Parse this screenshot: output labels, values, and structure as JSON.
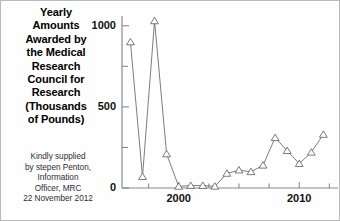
{
  "title": {
    "lines": [
      "Yearly",
      "Amounts",
      "Awarded by",
      "the Medical",
      "Research",
      "Council for",
      "Research",
      "(Thousands",
      "of Pounds)"
    ],
    "full": "Yearly Amounts Awarded by the Medical Research Council for Research (Thousands of Pounds)"
  },
  "credit": {
    "lines": [
      "Kindly supplied",
      "by stepen Penton,",
      "Information",
      "Officer, MRC",
      "22 November 2012"
    ],
    "full": "Kindly supplied by stepen Penton, Information Officer, MRC 22 November 2012"
  },
  "colors": {
    "line": "#6e6e6e",
    "marker_stroke": "#5a5a5a",
    "marker_fill": "#ffffff",
    "axis": "#808080",
    "text": "#000000",
    "background": "#ffffff",
    "border": "#b9b9b9"
  },
  "chart_data": {
    "type": "line",
    "title": "Yearly Amounts Awarded by the Medical Research Council for Research (Thousands of Pounds)",
    "xlabel": "",
    "ylabel": "Thousands of Pounds",
    "x": [
      1996,
      1997,
      1998,
      1999,
      2000,
      2001,
      2002,
      2003,
      2004,
      2005,
      2006,
      2007,
      2008,
      2009,
      2010,
      2011,
      2012
    ],
    "values": [
      900,
      70,
      1030,
      210,
      10,
      15,
      15,
      10,
      90,
      110,
      100,
      140,
      310,
      230,
      150,
      220,
      330
    ],
    "series": [
      {
        "name": "Yearly Amount Awarded",
        "values": [
          900,
          70,
          1030,
          210,
          10,
          15,
          15,
          10,
          90,
          110,
          100,
          140,
          310,
          230,
          150,
          220,
          330
        ]
      }
    ],
    "xlim": [
      1995.3,
      2012.8
    ],
    "ylim": [
      0,
      1060
    ],
    "yticks": [
      0,
      500,
      1000
    ],
    "ytick_labels": [
      "0",
      "500",
      "1000"
    ],
    "yminor_ticks": [
      250,
      750
    ],
    "xticks": [
      2000,
      2010
    ],
    "xtick_labels": [
      "2000",
      "2010"
    ],
    "xminor_ticks": [
      1997.5,
      2002.5,
      2005,
      2007.5,
      2012.5
    ],
    "grid": false,
    "legend": false,
    "marker": "triangle-up"
  }
}
